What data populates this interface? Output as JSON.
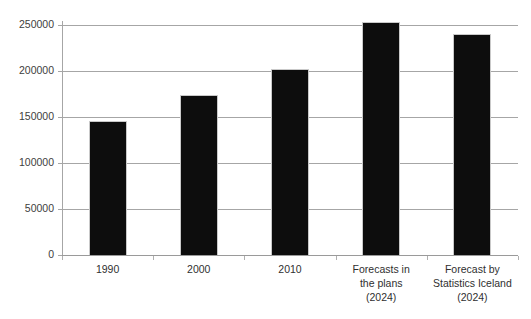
{
  "chart_data": {
    "type": "bar",
    "title": "",
    "subtitle": "",
    "xlabel": "",
    "ylabel": "",
    "categories": [
      "1990",
      "2000",
      "2010",
      "Forecasts in\nthe plans\n(2024)",
      "Forecast by\nStatistics Iceland\n(2024)"
    ],
    "values": [
      146000,
      174000,
      202000,
      253000,
      240000
    ],
    "ylim": [
      0,
      250000
    ],
    "ytick_labels": [
      "0",
      "50000",
      "100000",
      "150000",
      "200000",
      "250000"
    ],
    "ytick_values": [
      0,
      50000,
      100000,
      150000,
      200000,
      250000
    ],
    "grid": "horizontal",
    "legend": "none",
    "bar_color": "#0d0d0d",
    "gridline_color": "#a6a6a6",
    "background_color": "#ffffff"
  }
}
